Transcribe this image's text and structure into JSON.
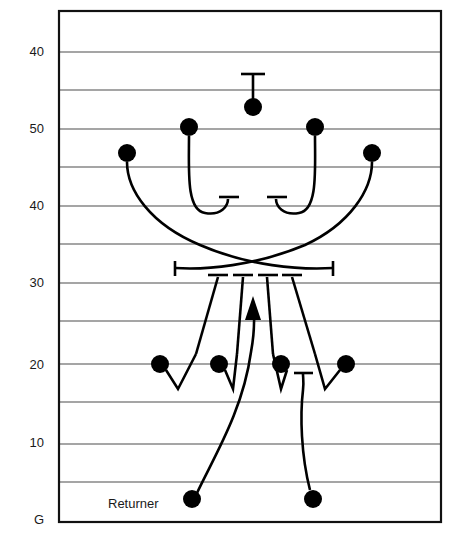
{
  "diagram": {
    "annotations": [
      {
        "name": "returner-label",
        "text": "Returner",
        "x": 108,
        "y": 508
      }
    ],
    "yard_labels": [
      {
        "text": "40",
        "x": 44,
        "y": 56
      },
      {
        "text": "50",
        "x": 44,
        "y": 133
      },
      {
        "text": "40",
        "x": 44,
        "y": 210
      },
      {
        "text": "30",
        "x": 44,
        "y": 287
      },
      {
        "text": "20",
        "x": 44,
        "y": 369
      },
      {
        "text": "10",
        "x": 44,
        "y": 447
      },
      {
        "text": "G",
        "x": 44,
        "y": 524
      }
    ],
    "field": {
      "border_color": "#111111",
      "line_color": "#4d4d4d",
      "background_color": "#ffffff",
      "left": 59,
      "right": 441,
      "top": 11,
      "bottom": 522
    },
    "yard_lines_y": [
      11,
      52,
      90,
      129,
      167,
      206,
      244,
      283,
      321,
      364,
      402,
      444,
      482,
      522
    ],
    "players": [
      {
        "name": "kicker",
        "x": 253,
        "y": 107,
        "r": 9
      },
      {
        "name": "kick-team-inside-left",
        "x": 189,
        "y": 127,
        "r": 9
      },
      {
        "name": "kick-team-inside-right",
        "x": 315,
        "y": 127,
        "r": 9
      },
      {
        "name": "kick-team-outside-left",
        "x": 127,
        "y": 153,
        "r": 9
      },
      {
        "name": "kick-team-outside-right",
        "x": 372,
        "y": 153,
        "r": 9
      },
      {
        "name": "return-blocker-1",
        "x": 160,
        "y": 364,
        "r": 9
      },
      {
        "name": "return-blocker-2",
        "x": 219,
        "y": 364,
        "r": 9
      },
      {
        "name": "return-blocker-3",
        "x": 281,
        "y": 364,
        "r": 9
      },
      {
        "name": "return-blocker-4",
        "x": 346,
        "y": 364,
        "r": 9
      },
      {
        "name": "returner-left",
        "x": 192,
        "y": 499,
        "r": 9
      },
      {
        "name": "returner-right",
        "x": 313,
        "y": 499,
        "r": 9
      }
    ],
    "routes": [
      {
        "name": "kicker-tee-stem",
        "path": "M 253 100 L 253 74"
      },
      {
        "name": "kicker-tee-bar",
        "path": "M 241 74 L 265 74"
      },
      {
        "name": "inside-left-hook",
        "path": "M 189 136 C 189 170 186 210 205 213 C 221 216 228 206 228 199"
      },
      {
        "name": "inside-left-hook-bar",
        "path": "M 219 197 L 239 197"
      },
      {
        "name": "inside-right-hook",
        "path": "M 315 136 C 315 170 318 210 299 213 C 283 216 276 206 276 199"
      },
      {
        "name": "inside-right-hook-bar",
        "path": "M 267 197 L 287 197"
      },
      {
        "name": "outside-left-cross",
        "path": "M 127 162 C 127 190 150 224 200 245 C 248 266 300 270 333 268"
      },
      {
        "name": "outside-left-cross-bar",
        "path": "M 333 261 L 333 276"
      },
      {
        "name": "outside-right-cross",
        "path": "M 372 162 C 372 190 350 224 305 245 C 255 266 205 270 175 268"
      },
      {
        "name": "outside-right-cross-bar",
        "path": "M 175 261 L 175 276"
      },
      {
        "name": "blocker-1-stem",
        "path": "M 218 277 L 196 354"
      },
      {
        "name": "blocker-1-bar",
        "path": "M 208 275 L 228 275"
      },
      {
        "name": "blocker-2-stem",
        "path": "M 243 277 L 237 354"
      },
      {
        "name": "blocker-2-bar",
        "path": "M 233 275 L 253 275"
      },
      {
        "name": "blocker-3-stem",
        "path": "M 267 277 L 273 354"
      },
      {
        "name": "blocker-3-bar",
        "path": "M 258 275 L 278 275"
      },
      {
        "name": "blocker-4-stem",
        "path": "M 292 277 L 315 354"
      },
      {
        "name": "blocker-4-bar",
        "path": "M 282 275 L 302 275"
      },
      {
        "name": "blocker-1-zigzag",
        "path": "M 166 370 L 178 389 L 196 354"
      },
      {
        "name": "blocker-2-zigzag",
        "path": "M 225 370 L 233 389 L 237 354"
      },
      {
        "name": "blocker-3-zigzag",
        "path": "M 287 370 L 281 389 L 273 354"
      },
      {
        "name": "blocker-4-zigzag",
        "path": "M 340 370 L 325 389 L 315 354"
      },
      {
        "name": "returner-left-return-path",
        "path": "M 197 493 C 215 455 243 410 251 352 C 256 325 254 310 253 302"
      },
      {
        "name": "returner-right-path",
        "path": "M 310 490 C 301 455 300 415 303 390 C 304 382 303 378 303 374"
      },
      {
        "name": "returner-right-path-bar",
        "path": "M 294 373 L 313 373"
      }
    ],
    "arrow": {
      "name": "return-direction-arrow",
      "tip_x": 253,
      "tip_y": 296,
      "points": "253,296 245,320 261,320"
    }
  }
}
